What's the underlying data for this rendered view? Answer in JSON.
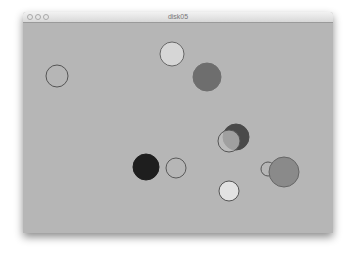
{
  "window": {
    "title": "disk05",
    "buttons": [
      "close",
      "minimize",
      "zoom"
    ]
  },
  "canvas": {
    "background": "#b6b6b6",
    "circles": [
      {
        "cx": 57,
        "cy": 76,
        "r": 11,
        "fill": "none",
        "stroke": "#555555"
      },
      {
        "cx": 172,
        "cy": 54,
        "r": 12,
        "fill": "#d6d6d6",
        "stroke": "#666666"
      },
      {
        "cx": 207,
        "cy": 77,
        "r": 14,
        "fill": "#6e6e6e",
        "stroke": "#6e6e6e"
      },
      {
        "cx": 236,
        "cy": 137,
        "r": 13,
        "fill": "#4a4a4a",
        "stroke": "#4a4a4a"
      },
      {
        "cx": 229,
        "cy": 141,
        "r": 11,
        "fill": "rgba(190,190,190,0.75)",
        "stroke": "#555555"
      },
      {
        "cx": 146,
        "cy": 167,
        "r": 13,
        "fill": "#1e1e1e",
        "stroke": "#1e1e1e"
      },
      {
        "cx": 176,
        "cy": 168,
        "r": 10,
        "fill": "none",
        "stroke": "#5a5a5a"
      },
      {
        "cx": 229,
        "cy": 191,
        "r": 10,
        "fill": "#e2e2e2",
        "stroke": "#555555"
      },
      {
        "cx": 268,
        "cy": 169,
        "r": 7,
        "fill": "none",
        "stroke": "#555555"
      },
      {
        "cx": 284,
        "cy": 172,
        "r": 15,
        "fill": "#8a8a8a",
        "stroke": "#666666"
      }
    ]
  }
}
